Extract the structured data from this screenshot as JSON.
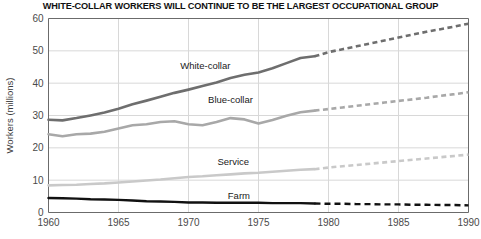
{
  "chart_data": {
    "type": "line",
    "title": "WHITE-COLLAR WORKERS WILL CONTINUE TO BE THE LARGEST OCCUPATIONAL GROUP",
    "xlabel": "",
    "ylabel": "Workers (millions)",
    "xlim": [
      1960,
      1990
    ],
    "ylim": [
      0,
      60
    ],
    "xticks": [
      1960,
      1965,
      1970,
      1975,
      1980,
      1985,
      1990
    ],
    "xtick_labels": [
      "1960",
      "1965",
      "1970",
      "1975",
      "1980",
      "1985",
      "1990"
    ],
    "yticks": [
      0,
      10,
      20,
      30,
      40,
      50,
      60
    ],
    "ytick_labels": [
      "0",
      "10",
      "20",
      "30",
      "40",
      "50",
      "60"
    ],
    "grid": true,
    "legend_position": "inline-labels",
    "projection_start_year": 1979,
    "series": [
      {
        "name": "White-collar",
        "color": "#6e6e6e",
        "label_x": 1971.2,
        "label_y": 44.5,
        "x": [
          1960,
          1961,
          1962,
          1963,
          1964,
          1965,
          1966,
          1967,
          1968,
          1969,
          1970,
          1971,
          1972,
          1973,
          1974,
          1975,
          1976,
          1977,
          1978,
          1979
        ],
        "values": [
          28.7,
          28.5,
          29.2,
          30.0,
          30.9,
          32.1,
          33.5,
          34.6,
          35.8,
          37.0,
          38.0,
          39.1,
          40.2,
          41.6,
          42.6,
          43.3,
          44.6,
          46.2,
          47.8,
          48.3
        ],
        "projection_x": [
          1979,
          1980,
          1981,
          1982,
          1983,
          1984,
          1985,
          1986,
          1987,
          1988,
          1989,
          1990
        ],
        "projection_values": [
          48.3,
          49.6,
          50.5,
          51.4,
          52.3,
          53.2,
          54.1,
          55.0,
          55.9,
          56.7,
          57.5,
          58.4
        ]
      },
      {
        "name": "Blue-collar",
        "color": "#a8a8a8",
        "label_x": 1973.0,
        "label_y": 34.0,
        "x": [
          1960,
          1961,
          1962,
          1963,
          1964,
          1965,
          1966,
          1967,
          1968,
          1969,
          1970,
          1971,
          1972,
          1973,
          1974,
          1975,
          1976,
          1977,
          1978,
          1979
        ],
        "values": [
          24.2,
          23.6,
          24.2,
          24.4,
          25.0,
          26.0,
          27.0,
          27.3,
          28.0,
          28.2,
          27.3,
          27.0,
          28.0,
          29.2,
          28.8,
          27.5,
          28.6,
          29.9,
          31.0,
          31.5
        ],
        "projection_x": [
          1979,
          1980,
          1981,
          1982,
          1983,
          1984,
          1985,
          1986,
          1987,
          1988,
          1989,
          1990
        ],
        "projection_values": [
          31.5,
          32.0,
          32.5,
          33.0,
          33.5,
          34.0,
          34.5,
          35.0,
          35.5,
          36.1,
          36.6,
          37.2
        ]
      },
      {
        "name": "Service",
        "color": "#c9c9c9",
        "label_x": 1973.2,
        "label_y": 14.6,
        "x": [
          1960,
          1961,
          1962,
          1963,
          1964,
          1965,
          1966,
          1967,
          1968,
          1969,
          1970,
          1971,
          1972,
          1973,
          1974,
          1975,
          1976,
          1977,
          1978,
          1979
        ],
        "values": [
          8.4,
          8.5,
          8.6,
          8.8,
          9.0,
          9.3,
          9.6,
          9.9,
          10.2,
          10.6,
          11.0,
          11.2,
          11.5,
          11.8,
          12.1,
          12.3,
          12.6,
          12.9,
          13.2,
          13.4
        ],
        "projection_x": [
          1979,
          1980,
          1981,
          1982,
          1983,
          1984,
          1985,
          1986,
          1987,
          1988,
          1989,
          1990
        ],
        "projection_values": [
          13.4,
          13.9,
          14.3,
          14.7,
          15.1,
          15.5,
          15.9,
          16.3,
          16.7,
          17.1,
          17.5,
          17.9
        ]
      },
      {
        "name": "Farm",
        "color": "#111111",
        "label_x": 1973.6,
        "label_y": 4.2,
        "x": [
          1960,
          1961,
          1962,
          1963,
          1964,
          1965,
          1966,
          1967,
          1968,
          1969,
          1970,
          1971,
          1972,
          1973,
          1974,
          1975,
          1976,
          1977,
          1978,
          1979
        ],
        "values": [
          4.5,
          4.4,
          4.3,
          4.1,
          4.0,
          3.9,
          3.7,
          3.5,
          3.4,
          3.3,
          3.1,
          3.1,
          3.0,
          3.0,
          3.0,
          3.0,
          2.9,
          2.9,
          2.9,
          2.8
        ],
        "projection_x": [
          1979,
          1980,
          1981,
          1982,
          1983,
          1984,
          1985,
          1986,
          1987,
          1988,
          1989,
          1990
        ],
        "projection_values": [
          2.8,
          2.7,
          2.7,
          2.6,
          2.6,
          2.5,
          2.5,
          2.4,
          2.4,
          2.3,
          2.3,
          2.2
        ]
      }
    ]
  },
  "colors": {
    "background": "#ffffff",
    "axis": "#6b6b6b",
    "grid": "#d8d8d8",
    "title_text": "#111111",
    "tick_text": "#4a4a4a"
  }
}
